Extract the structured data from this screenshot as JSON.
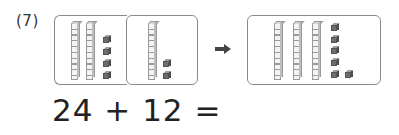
{
  "problem": {
    "label": "(7)",
    "equation": "24 + 12 ="
  },
  "colors": {
    "box_border": "#8a8a8a",
    "rod_fill": "#f4f4f4",
    "cube_fill": "#6d6d6d",
    "arrow": "#444444",
    "text": "#222222"
  },
  "groups": [
    {
      "name": "first-addend",
      "tens": 2,
      "ones": 4
    },
    {
      "name": "second-addend",
      "tens": 1,
      "ones": 2
    },
    {
      "name": "sum-result",
      "tens": 3,
      "ones": 6
    }
  ],
  "arrow_icon": "right-arrow-icon"
}
